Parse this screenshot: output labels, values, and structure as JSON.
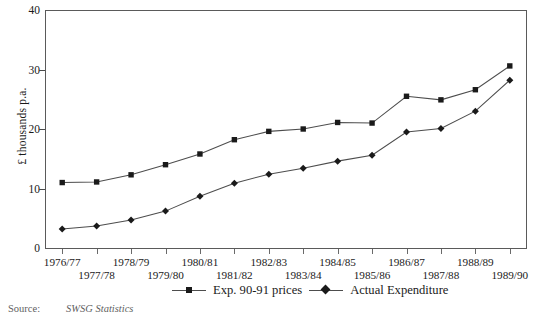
{
  "chart_data": {
    "type": "line",
    "title": "",
    "xlabel": "",
    "ylabel": "£ thousands p.a.",
    "ylim": [
      0,
      40
    ],
    "yticks": [
      0,
      10,
      20,
      30,
      40
    ],
    "grid": false,
    "legend_position": "bottom",
    "categories": [
      "1976/77",
      "1977/78",
      "1978/79",
      "1979/80",
      "1980/81",
      "1981/82",
      "1982/83",
      "1983/84",
      "1984/85",
      "1985/86",
      "1986/87",
      "1987/88",
      "1988/89",
      "1989/90"
    ],
    "series": [
      {
        "name": "Exp. 90-91 prices",
        "marker": "square",
        "values": [
          11.0,
          11.1,
          12.3,
          14.0,
          15.8,
          18.2,
          19.6,
          20.0,
          21.1,
          21.0,
          25.5,
          24.9,
          26.6,
          30.6
        ]
      },
      {
        "name": "Actual Expenditure",
        "marker": "diamond",
        "values": [
          3.2,
          3.7,
          4.7,
          6.2,
          8.7,
          10.9,
          12.4,
          13.4,
          14.6,
          15.6,
          19.5,
          20.1,
          23.0,
          28.2
        ]
      }
    ]
  },
  "axis": {
    "y_label": "£ thousands p.a.",
    "y_tick_labels": [
      "0",
      "10",
      "20",
      "30",
      "40"
    ],
    "x_tick_labels": [
      "1976/77",
      "1977/78",
      "1978/79",
      "1979/80",
      "1980/81",
      "1981/82",
      "1982/83",
      "1983/84",
      "1984/85",
      "1985/86",
      "1986/87",
      "1987/88",
      "1988/89",
      "1989/90"
    ]
  },
  "legend": {
    "items": [
      {
        "label": "Exp. 90-91 prices",
        "marker": "square"
      },
      {
        "label": "Actual Expenditure",
        "marker": "diamond"
      }
    ]
  },
  "footnote": {
    "label": "Source:",
    "value": "SWSG Statistics"
  },
  "colors": {
    "line": "#4d4d4d",
    "marker": "#1a1a1a",
    "axis": "#5a5a5a",
    "text": "#1a1a1a"
  }
}
